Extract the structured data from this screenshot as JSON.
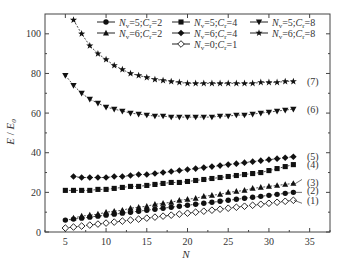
{
  "chart_data": {
    "type": "line",
    "title": "",
    "xlabel": "N",
    "ylabel": "E / E0",
    "xlim": [
      2.5,
      37.5
    ],
    "ylim": [
      0,
      110
    ],
    "xticks": [
      5,
      10,
      15,
      20,
      25,
      30,
      35
    ],
    "yticks": [
      0,
      20,
      40,
      60,
      80,
      100
    ],
    "grid": false,
    "legend_position": "top-inside",
    "series": [
      {
        "name": "Nv=5;Cr=2",
        "marker": "circle-filled",
        "curve_label": "(2)",
        "x": [
          5,
          6,
          7,
          8,
          9,
          10,
          11,
          12,
          13,
          14,
          15,
          16,
          17,
          18,
          19,
          20,
          21,
          22,
          23,
          24,
          25,
          26,
          27,
          28,
          29,
          30,
          31,
          32,
          33
        ],
        "values": [
          6,
          6.5,
          7,
          7.5,
          8,
          8.5,
          9,
          9.5,
          10,
          10.5,
          11,
          11.5,
          12,
          12.5,
          13,
          13.5,
          14,
          14.5,
          15,
          15.5,
          16,
          16.5,
          17,
          17.5,
          18,
          18.5,
          19,
          19.5,
          20
        ]
      },
      {
        "name": "Nv=6;Cr=2",
        "marker": "triangle-up-filled",
        "curve_label": "(3)",
        "x": [
          6,
          7,
          8,
          9,
          10,
          11,
          12,
          13,
          14,
          15,
          16,
          17,
          18,
          19,
          20,
          21,
          22,
          23,
          24,
          25,
          26,
          27,
          28,
          29,
          30,
          31,
          32,
          33
        ],
        "values": [
          7,
          8,
          8.5,
          9,
          10,
          10.5,
          11,
          12,
          12.5,
          13,
          14,
          14.5,
          15,
          16,
          16.5,
          17,
          18,
          18.5,
          19,
          20,
          20.5,
          21,
          22,
          22.5,
          23,
          23.5,
          24,
          24.5
        ]
      },
      {
        "name": "Nv=5;Cr=4",
        "marker": "square-filled",
        "curve_label": "(4)",
        "x": [
          5,
          6,
          7,
          8,
          9,
          10,
          11,
          12,
          13,
          14,
          15,
          16,
          17,
          18,
          19,
          20,
          21,
          22,
          23,
          24,
          25,
          26,
          27,
          28,
          29,
          30,
          31,
          32,
          33
        ],
        "values": [
          21,
          21,
          21,
          21,
          21.5,
          21.5,
          22,
          22.5,
          23,
          23,
          23.5,
          24,
          24.5,
          25,
          25,
          25.5,
          26,
          26.5,
          27,
          27.5,
          28,
          28.5,
          29,
          29.5,
          30,
          31,
          32,
          33,
          34
        ]
      },
      {
        "name": "Nv=6;Cr=4",
        "marker": "diamond-filled",
        "curve_label": "(5)",
        "x": [
          6,
          7,
          8,
          9,
          10,
          11,
          12,
          13,
          14,
          15,
          16,
          17,
          18,
          19,
          20,
          21,
          22,
          23,
          24,
          25,
          26,
          27,
          28,
          29,
          30,
          31,
          32,
          33
        ],
        "values": [
          28,
          27.5,
          27.5,
          27.5,
          27.5,
          28,
          28,
          28.5,
          29,
          29,
          29.5,
          30,
          30.5,
          31,
          31.5,
          32,
          32.5,
          33,
          33.5,
          34,
          34.5,
          35,
          35.5,
          36,
          36.5,
          37,
          37.5,
          38
        ]
      },
      {
        "name": "Nv=5;Cr=8",
        "marker": "triangle-down-filled",
        "curve_label": "(6)",
        "x": [
          5,
          6,
          7,
          8,
          9,
          10,
          11,
          12,
          13,
          14,
          15,
          16,
          17,
          18,
          19,
          20,
          21,
          22,
          23,
          24,
          25,
          26,
          27,
          28,
          29,
          30,
          31,
          32,
          33
        ],
        "values": [
          79,
          74,
          70,
          67,
          65,
          63,
          62,
          61,
          60,
          59.5,
          59,
          58.5,
          58.5,
          58,
          58,
          58,
          58,
          58,
          58,
          58.5,
          58.5,
          59,
          59,
          59.5,
          60,
          60.5,
          61,
          61.5,
          62
        ]
      },
      {
        "name": "Nv=6;Cr=8",
        "marker": "star-filled",
        "curve_label": "(7)",
        "x": [
          6,
          7,
          8,
          9,
          10,
          11,
          12,
          13,
          14,
          15,
          16,
          17,
          18,
          19,
          20,
          21,
          22,
          23,
          24,
          25,
          26,
          27,
          28,
          29,
          30,
          31,
          32,
          33
        ],
        "values": [
          107,
          100,
          94,
          90,
          87,
          84,
          82,
          80,
          79,
          78,
          77,
          76.5,
          76,
          75.5,
          75,
          75,
          75,
          75,
          75,
          75,
          75,
          75,
          75,
          75.5,
          75.5,
          75.5,
          76,
          76
        ]
      },
      {
        "name": "Nv=0;Cr=1",
        "marker": "diamond-open",
        "curve_label": "(1)",
        "x": [
          5,
          6,
          7,
          8,
          9,
          10,
          11,
          12,
          13,
          14,
          15,
          16,
          17,
          18,
          19,
          20,
          21,
          22,
          23,
          24,
          25,
          26,
          27,
          28,
          29,
          30,
          31,
          32,
          33
        ],
        "values": [
          2,
          2.5,
          3,
          3.5,
          4,
          4.5,
          5,
          5.5,
          6,
          6.5,
          7,
          7.5,
          8,
          8.5,
          9,
          9.5,
          10,
          10.5,
          11,
          11.5,
          12,
          12.5,
          13,
          13.5,
          14,
          14.5,
          15,
          15.5,
          16
        ]
      }
    ],
    "legend": [
      {
        "label_prefix": "N",
        "label_sub": "v",
        "label_rest": "=5;",
        "label_c": "C",
        "label_csub": "r",
        "label_end": "=2",
        "marker": "circle-filled"
      },
      {
        "label_prefix": "N",
        "label_sub": "v",
        "label_rest": "=5;",
        "label_c": "C",
        "label_csub": "r",
        "label_end": "=4",
        "marker": "square-filled"
      },
      {
        "label_prefix": "N",
        "label_sub": "v",
        "label_rest": "=5;",
        "label_c": "C",
        "label_csub": "r",
        "label_end": "=8",
        "marker": "triangle-down-filled"
      },
      {
        "label_prefix": "N",
        "label_sub": "v",
        "label_rest": "=6;",
        "label_c": "C",
        "label_csub": "r",
        "label_end": "=2",
        "marker": "triangle-up-filled"
      },
      {
        "label_prefix": "N",
        "label_sub": "v",
        "label_rest": "=6;",
        "label_c": "C",
        "label_csub": "r",
        "label_end": "=4",
        "marker": "diamond-filled"
      },
      {
        "label_prefix": "N",
        "label_sub": "v",
        "label_rest": "=6;",
        "label_c": "C",
        "label_csub": "r",
        "label_end": "=8",
        "marker": "star-filled"
      },
      {
        "label_prefix": "N",
        "label_sub": "v",
        "label_rest": "=0;",
        "label_c": "C",
        "label_csub": "r",
        "label_end": "=1",
        "marker": "diamond-open"
      }
    ],
    "curve_labels": [
      {
        "text": "(7)",
        "y": 76
      },
      {
        "text": "(6)",
        "y": 62
      },
      {
        "text": "(5)",
        "y": 38
      },
      {
        "text": "(4)",
        "y": 34
      },
      {
        "text": "(3)",
        "y": 25
      },
      {
        "text": "(2)",
        "y": 21
      },
      {
        "text": "(1)",
        "y": 16
      }
    ]
  },
  "axes": {
    "xlabel": "N",
    "ylabel_main": "E",
    "ylabel_sep": " / ",
    "ylabel_den": "E",
    "ylabel_den_sub": "0"
  }
}
